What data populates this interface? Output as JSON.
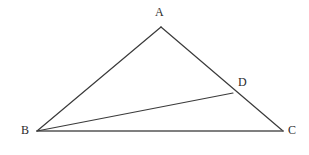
{
  "figure": {
    "kind": "geometry-diagram",
    "canvas": {
      "width": 309,
      "height": 155,
      "background": "#ffffff"
    },
    "style": {
      "edge_color": "#3a3a3a",
      "base_color": "#555555",
      "cevian_color": "#3a3a3a",
      "label_color": "#2b2b2b",
      "edge_width": 1.2,
      "base_width": 1.6,
      "label_font_size": 12
    },
    "points": [
      {
        "id": "A",
        "label": "A",
        "x": 161,
        "y": 27,
        "label_x": 155,
        "label_y": 6,
        "role": "apex-vertex"
      },
      {
        "id": "B",
        "label": "B",
        "x": 37,
        "y": 131,
        "label_x": 21,
        "label_y": 124,
        "role": "base-left-vertex"
      },
      {
        "id": "C",
        "label": "C",
        "x": 283,
        "y": 131,
        "label_x": 288,
        "label_y": 124,
        "role": "base-right-vertex"
      },
      {
        "id": "D",
        "label": "D",
        "x": 233,
        "y": 93,
        "label_x": 238,
        "label_y": 76,
        "role": "point-on-side-AC"
      }
    ],
    "segments": [
      {
        "id": "AB",
        "from": "A",
        "to": "B",
        "name": "side-ab",
        "color": "#3a3a3a",
        "width": 1.2
      },
      {
        "id": "AC",
        "from": "A",
        "to": "C",
        "name": "side-ac",
        "color": "#3a3a3a",
        "width": 1.2
      },
      {
        "id": "BC",
        "from": "B",
        "to": "C",
        "name": "side-bc-base",
        "color": "#555555",
        "width": 1.6
      },
      {
        "id": "BD",
        "from": "B",
        "to": "D",
        "name": "cevian-bd",
        "color": "#3a3a3a",
        "width": 1.2
      }
    ]
  }
}
